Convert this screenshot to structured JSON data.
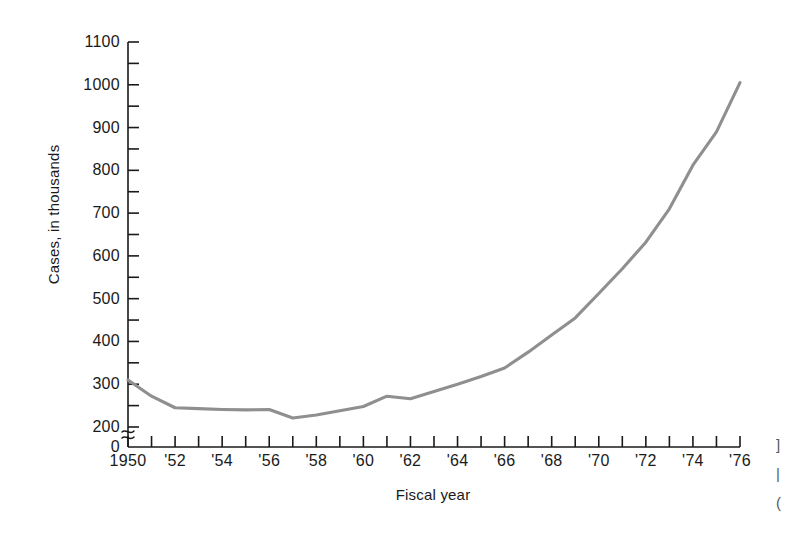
{
  "chart_data": {
    "type": "line",
    "title": "",
    "xlabel": "Fiscal year",
    "ylabel": "Cases, in thousands",
    "xlim": [
      1950,
      1976
    ],
    "ylim": [
      200,
      1100
    ],
    "y_axis_break": true,
    "y_zero_label": "0",
    "grid": false,
    "legend": null,
    "y_ticks_major": [
      200,
      300,
      400,
      500,
      600,
      700,
      800,
      900,
      1000,
      1100
    ],
    "y_ticks_minor": [
      250,
      350,
      450,
      550,
      650,
      750,
      850,
      950,
      1050
    ],
    "y_tick_labels": [
      "200",
      "300",
      "400",
      "500",
      "600",
      "700",
      "800",
      "900",
      "1000",
      "1100"
    ],
    "x_ticks": [
      1950,
      1951,
      1952,
      1953,
      1954,
      1955,
      1956,
      1957,
      1958,
      1959,
      1960,
      1961,
      1962,
      1963,
      1964,
      1965,
      1966,
      1967,
      1968,
      1969,
      1970,
      1971,
      1972,
      1973,
      1974,
      1975,
      1976
    ],
    "x_tick_labels": [
      "1950",
      "'52",
      "'54",
      "'56",
      "'58",
      "'60",
      "'62",
      "'64",
      "'66",
      "'68",
      "'70",
      "'72",
      "'74",
      "'76"
    ],
    "x_labeled_years": [
      1950,
      1952,
      1954,
      1956,
      1958,
      1960,
      1962,
      1964,
      1966,
      1968,
      1970,
      1972,
      1974,
      1976
    ],
    "series": [
      {
        "name": "Cases",
        "color": "#8f8f8f",
        "x": [
          1950,
          1951,
          1952,
          1953,
          1954,
          1955,
          1956,
          1957,
          1958,
          1959,
          1960,
          1961,
          1962,
          1963,
          1964,
          1965,
          1966,
          1967,
          1968,
          1969,
          1970,
          1971,
          1972,
          1973,
          1974,
          1975,
          1976
        ],
        "values": [
          310,
          272,
          245,
          243,
          241,
          240,
          241,
          221,
          228,
          238,
          248,
          272,
          266,
          283,
          300,
          318,
          338,
          375,
          415,
          455,
          512,
          570,
          632,
          710,
          812,
          890,
          1005
        ]
      }
    ]
  },
  "axis": {
    "line_color": "#1a1a1a",
    "tick_color": "#1a1a1a"
  },
  "edge_bleed": {
    "lines": [
      "]",
      "|",
      "("
    ]
  }
}
